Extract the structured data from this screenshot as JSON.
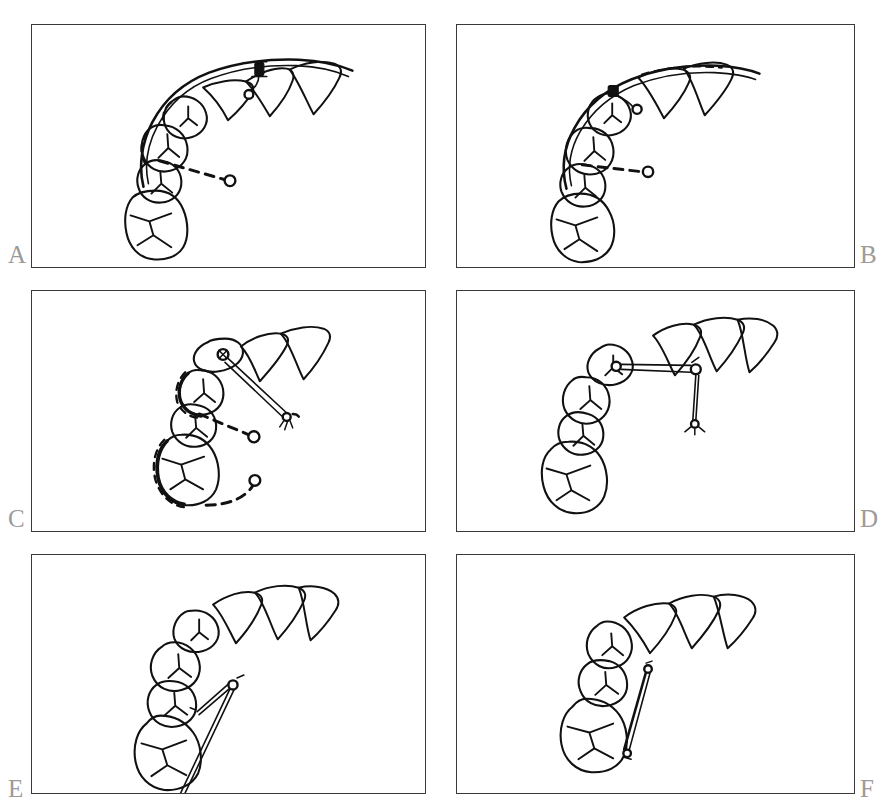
{
  "figure": {
    "background_color": "#ffffff",
    "ink_color": "#111111",
    "panel_border_color": "#3a3a3a",
    "label_color": "#9b9b9b",
    "panel_count": 6,
    "columns": 2,
    "rows": 3
  },
  "panels": [
    {
      "id": "A",
      "label": "A",
      "label_position": "bottom-left-outside",
      "caption": "Continuous archwire engaged along posterior segment with bonded button; dashed line indicates direction of impacted canine crown",
      "elements": {
        "teeth_count": 7,
        "archwire": "continuous-archwire",
        "attachment": "bonded-button",
        "traction": "dashed-vector-to-impacted-crown",
        "impacted_marker": "open-circle"
      }
    },
    {
      "id": "B",
      "label": "B",
      "label_position": "bottom-right-outside",
      "caption": "Archwire with stop loop and ligature at premolar; dashed traction line toward impacted canine position",
      "elements": {
        "teeth_count": 7,
        "archwire": "continuous-archwire",
        "attachment": "stop-loop-and-ligature",
        "traction": "dashed-vector-to-impacted-crown",
        "impacted_marker": "open-circle"
      }
    },
    {
      "id": "C",
      "label": "C",
      "label_position": "bottom-left-outside",
      "caption": "Erupting canine with bonded eyelet attachment tied by elastomeric chain; dashed outlines show previous tooth positions",
      "elements": {
        "teeth_count": 6,
        "archwire": "none",
        "attachment": "bonded-eyelet",
        "traction": "elastic-chain-plus-dashed-path",
        "impacted_marker": "open-circle"
      }
    },
    {
      "id": "D",
      "label": "D",
      "label_position": "bottom-right-outside",
      "caption": "Canine aligned in arch; transpalatal connector between eyelet and anchor ring with vertical elastic to palatal attachment",
      "elements": {
        "teeth_count": 7,
        "archwire": "segmental-connector",
        "attachment": "two-rings-with-vertical-elastic",
        "traction": "rigid-connector",
        "impacted_marker": "palatal-anchor"
      }
    },
    {
      "id": "E",
      "label": "E",
      "label_position": "bottom-left-outside",
      "caption": "Canine erupted into arch with elastic thread from molar to premolar region",
      "elements": {
        "teeth_count": 7,
        "archwire": "none",
        "attachment": "bonded-button-and-thread",
        "traction": "elastic-thread-molar-to-premolar",
        "impacted_marker": "open-circle"
      }
    },
    {
      "id": "F",
      "label": "F",
      "label_position": "bottom-right-outside",
      "caption": "Final alignment with short elastic thread between molar and premolar attachments",
      "elements": {
        "teeth_count": 6,
        "archwire": "none",
        "attachment": "bonded-buttons",
        "traction": "short-elastic-thread",
        "impacted_marker": "none"
      }
    }
  ]
}
